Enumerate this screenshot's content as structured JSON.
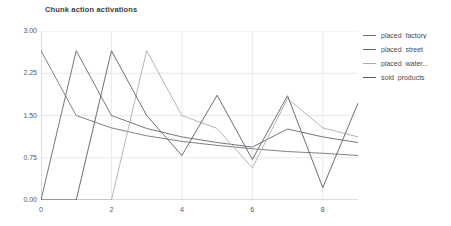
{
  "chart_data": {
    "type": "line",
    "title": "Chunk action activations",
    "xlabel": "",
    "ylabel": "",
    "xlim": [
      0,
      9
    ],
    "ylim": [
      0,
      3.0
    ],
    "grid": true,
    "legend_position": "right",
    "xticks": [
      "0",
      "2",
      "4",
      "6",
      "8"
    ],
    "xtick_values": [
      0,
      2,
      4,
      6,
      8
    ],
    "yticks": [
      "0.00",
      "0.75",
      "1.50",
      "2.25",
      "3.00"
    ],
    "ytick_values": [
      0.0,
      0.75,
      1.5,
      2.25,
      3.0
    ],
    "x": [
      0,
      1,
      2,
      3,
      4,
      5,
      6,
      7,
      8,
      9
    ],
    "series": [
      {
        "name": "placed_factory",
        "color": "#6f7479",
        "values": [
          2.65,
          1.5,
          1.28,
          1.14,
          1.04,
          0.97,
          0.91,
          0.86,
          0.83,
          0.79
        ]
      },
      {
        "name": "placed_street",
        "color": "#63686d",
        "values": [
          0.0,
          2.65,
          1.5,
          1.27,
          1.12,
          1.02,
          0.94,
          1.26,
          1.12,
          1.02
        ]
      },
      {
        "name": "placed_water...",
        "color": "#a9aeb2",
        "values": [
          0.0,
          0.0,
          0.0,
          2.65,
          1.5,
          1.27,
          0.57,
          1.8,
          1.28,
          1.12
        ]
      },
      {
        "name": "sold_products",
        "color": "#5a5f64",
        "values": [
          0.0,
          0.0,
          2.65,
          1.5,
          0.79,
          1.86,
          0.72,
          1.85,
          0.22,
          1.72
        ]
      }
    ],
    "annotations": [
      {
        "text": "sawtooth activation decay with re-activation spikes"
      }
    ]
  },
  "legend": {
    "items": [
      {
        "label": "placed_factory"
      },
      {
        "label": "placed_street"
      },
      {
        "label": "placed_water..."
      },
      {
        "label": "sold_products"
      }
    ]
  }
}
